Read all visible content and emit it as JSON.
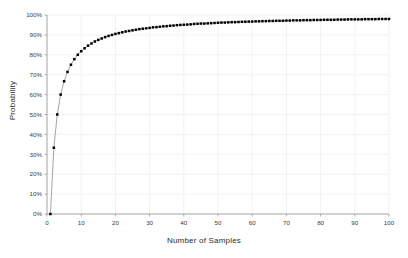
{
  "chart_data": {
    "type": "line",
    "title": "",
    "subtitle": "",
    "xlabel": "Number of Samples",
    "ylabel": "Probability",
    "xlim": [
      0,
      100
    ],
    "ylim": [
      0,
      1
    ],
    "grid": true,
    "legend": null,
    "marker": "square",
    "marker_color": "#000000",
    "line_color": "#9a9a9a",
    "grid_color": "#ededed",
    "axis_color": "#9a9a9a",
    "xticks": [
      0,
      10,
      20,
      30,
      40,
      50,
      60,
      70,
      80,
      90,
      100
    ],
    "xticklabels": [
      "0",
      "10",
      "20",
      "30",
      "40",
      "50",
      "60",
      "70",
      "80",
      "90",
      "100"
    ],
    "yticks": [
      0,
      0.1,
      0.2,
      0.3,
      0.4,
      0.5,
      0.6,
      0.7,
      0.8,
      0.9,
      1.0
    ],
    "yticklabels": [
      "0%",
      "10%",
      "20%",
      "30%",
      "40%",
      "50%",
      "60%",
      "70%",
      "80%",
      "90%",
      "100%"
    ],
    "x": [
      1,
      2,
      3,
      4,
      5,
      6,
      7,
      8,
      9,
      10,
      11,
      12,
      13,
      14,
      15,
      16,
      17,
      18,
      19,
      20,
      21,
      22,
      23,
      24,
      25,
      26,
      27,
      28,
      29,
      30,
      31,
      32,
      33,
      34,
      35,
      36,
      37,
      38,
      39,
      40,
      41,
      42,
      43,
      44,
      45,
      46,
      47,
      48,
      49,
      50,
      51,
      52,
      53,
      54,
      55,
      56,
      57,
      58,
      59,
      60,
      61,
      62,
      63,
      64,
      65,
      66,
      67,
      68,
      69,
      70,
      71,
      72,
      73,
      74,
      75,
      76,
      77,
      78,
      79,
      80,
      81,
      82,
      83,
      84,
      85,
      86,
      87,
      88,
      89,
      90,
      91,
      92,
      93,
      94,
      95,
      96,
      97,
      98,
      99,
      100
    ],
    "values": [
      0.0,
      0.333,
      0.5,
      0.6,
      0.667,
      0.714,
      0.75,
      0.778,
      0.8,
      0.818,
      0.833,
      0.846,
      0.857,
      0.867,
      0.875,
      0.882,
      0.889,
      0.895,
      0.9,
      0.905,
      0.909,
      0.913,
      0.917,
      0.92,
      0.923,
      0.926,
      0.929,
      0.931,
      0.933,
      0.935,
      0.938,
      0.939,
      0.941,
      0.943,
      0.944,
      0.946,
      0.947,
      0.949,
      0.95,
      0.951,
      0.952,
      0.953,
      0.955,
      0.956,
      0.957,
      0.957,
      0.958,
      0.959,
      0.96,
      0.961,
      0.962,
      0.962,
      0.963,
      0.964,
      0.964,
      0.965,
      0.966,
      0.966,
      0.967,
      0.967,
      0.968,
      0.968,
      0.969,
      0.969,
      0.97,
      0.97,
      0.971,
      0.971,
      0.971,
      0.972,
      0.972,
      0.973,
      0.973,
      0.973,
      0.974,
      0.974,
      0.974,
      0.975,
      0.975,
      0.975,
      0.976,
      0.976,
      0.976,
      0.976,
      0.977,
      0.977,
      0.977,
      0.978,
      0.978,
      0.978,
      0.978,
      0.978,
      0.979,
      0.979,
      0.979,
      0.979,
      0.98,
      0.98,
      0.98,
      0.98
    ],
    "series": [
      {
        "name": "Probability",
        "values": [
          0.0,
          0.333,
          0.5,
          0.6,
          0.667,
          0.714,
          0.75,
          0.778,
          0.8,
          0.818,
          0.833,
          0.846,
          0.857,
          0.867,
          0.875,
          0.882,
          0.889,
          0.895,
          0.9,
          0.905,
          0.909,
          0.913,
          0.917,
          0.92,
          0.923,
          0.926,
          0.929,
          0.931,
          0.933,
          0.935,
          0.938,
          0.939,
          0.941,
          0.943,
          0.944,
          0.946,
          0.947,
          0.949,
          0.95,
          0.951,
          0.952,
          0.953,
          0.955,
          0.956,
          0.957,
          0.957,
          0.958,
          0.959,
          0.96,
          0.961,
          0.962,
          0.962,
          0.963,
          0.964,
          0.964,
          0.965,
          0.966,
          0.966,
          0.967,
          0.967,
          0.968,
          0.968,
          0.969,
          0.969,
          0.97,
          0.97,
          0.971,
          0.971,
          0.971,
          0.972,
          0.972,
          0.973,
          0.973,
          0.973,
          0.974,
          0.974,
          0.974,
          0.975,
          0.975,
          0.975,
          0.976,
          0.976,
          0.976,
          0.976,
          0.977,
          0.977,
          0.977,
          0.978,
          0.978,
          0.978,
          0.978,
          0.978,
          0.979,
          0.979,
          0.979,
          0.979,
          0.98,
          0.98,
          0.98,
          0.98
        ]
      }
    ]
  },
  "figure": {
    "background": "#ffffff",
    "x_axis_title": "Number of Samples",
    "y_axis_title": "Probability"
  }
}
